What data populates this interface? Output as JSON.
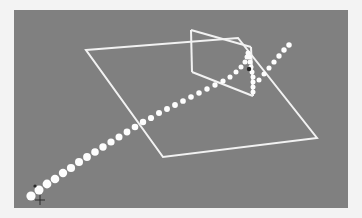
{
  "figure": {
    "background_color": "#808080",
    "frame_color": "#f3f3f3",
    "line_color": "#f2f2f2",
    "ball_color": "#fdfdfd",
    "marker_color": "#2a2a2a"
  },
  "chart_data": {
    "type": "scatter",
    "subtitle": "",
    "xlabel": "",
    "ylabel": "",
    "grid": false,
    "legend": "none",
    "projection": "3d-perspective",
    "xlim": [
      0,
      334
    ],
    "ylim": [
      0,
      198
    ],
    "annotations": [],
    "series": [
      {
        "name": "ball-trajectory",
        "marker": "circle",
        "color": "#fdfdfd",
        "points": [
          {
            "x": 17,
            "y": 186,
            "r": 4.6
          },
          {
            "x": 25,
            "y": 180,
            "r": 4.5
          },
          {
            "x": 33,
            "y": 174,
            "r": 4.4
          },
          {
            "x": 41,
            "y": 169,
            "r": 4.3
          },
          {
            "x": 49,
            "y": 163,
            "r": 4.2
          },
          {
            "x": 57,
            "y": 158,
            "r": 4.1
          },
          {
            "x": 65,
            "y": 152,
            "r": 4.0
          },
          {
            "x": 73,
            "y": 147,
            "r": 3.9
          },
          {
            "x": 81,
            "y": 142,
            "r": 3.8
          },
          {
            "x": 89,
            "y": 137,
            "r": 3.7
          },
          {
            "x": 97,
            "y": 132,
            "r": 3.6
          },
          {
            "x": 105,
            "y": 127,
            "r": 3.5
          },
          {
            "x": 113,
            "y": 122,
            "r": 3.4
          },
          {
            "x": 121,
            "y": 117,
            "r": 3.3
          },
          {
            "x": 129,
            "y": 112,
            "r": 3.2
          },
          {
            "x": 137,
            "y": 108,
            "r": 3.1
          },
          {
            "x": 145,
            "y": 103,
            "r": 3.0
          },
          {
            "x": 153,
            "y": 99,
            "r": 2.95
          },
          {
            "x": 161,
            "y": 95,
            "r": 2.9
          },
          {
            "x": 169,
            "y": 91,
            "r": 2.85
          },
          {
            "x": 177,
            "y": 87,
            "r": 2.8
          },
          {
            "x": 185,
            "y": 83,
            "r": 2.75
          },
          {
            "x": 193,
            "y": 79,
            "r": 2.7
          },
          {
            "x": 201,
            "y": 75,
            "r": 2.65
          },
          {
            "x": 209,
            "y": 71,
            "r": 2.6
          },
          {
            "x": 216,
            "y": 67,
            "r": 2.55
          },
          {
            "x": 222,
            "y": 62,
            "r": 2.5
          },
          {
            "x": 227,
            "y": 57,
            "r": 2.5
          },
          {
            "x": 231,
            "y": 52,
            "r": 2.5
          },
          {
            "x": 233,
            "y": 47,
            "r": 2.5
          },
          {
            "x": 234,
            "y": 43,
            "r": 2.5
          },
          {
            "x": 235,
            "y": 47,
            "r": 2.5
          },
          {
            "x": 236,
            "y": 52,
            "r": 2.5
          },
          {
            "x": 237,
            "y": 57,
            "r": 2.5
          },
          {
            "x": 238,
            "y": 62,
            "r": 2.5
          },
          {
            "x": 239,
            "y": 67,
            "r": 2.5
          },
          {
            "x": 239,
            "y": 72,
            "r": 2.5
          },
          {
            "x": 239,
            "y": 77,
            "r": 2.5
          },
          {
            "x": 239,
            "y": 82,
            "r": 2.5
          }
        ]
      },
      {
        "name": "ball-rebound",
        "marker": "circle",
        "color": "#fdfdfd",
        "points": [
          {
            "x": 245,
            "y": 70,
            "r": 2.5
          },
          {
            "x": 250,
            "y": 64,
            "r": 2.5
          },
          {
            "x": 255,
            "y": 58,
            "r": 2.55
          },
          {
            "x": 260,
            "y": 52,
            "r": 2.6
          },
          {
            "x": 265,
            "y": 46,
            "r": 2.65
          },
          {
            "x": 270,
            "y": 40,
            "r": 2.7
          },
          {
            "x": 275,
            "y": 35,
            "r": 2.75
          }
        ]
      }
    ],
    "markers": [
      {
        "name": "impact-point",
        "x": 235,
        "y": 59,
        "r": 2.2,
        "color": "#2a2a2a"
      },
      {
        "name": "origin-point",
        "x": 21,
        "y": 176,
        "r": 1.6,
        "color": "#2a2a2a"
      },
      {
        "name": "origin-cross",
        "x": 26,
        "y": 190,
        "size": 5,
        "color": "#2a2a2a"
      }
    ],
    "geometry": {
      "table": {
        "name": "table-outline",
        "points": [
          [
            72,
            40
          ],
          [
            224,
            28
          ],
          [
            303,
            128
          ],
          [
            149,
            147
          ]
        ]
      },
      "net": {
        "name": "net-outline",
        "top_left": [
          177,
          20
        ],
        "top_right": [
          237,
          37
        ],
        "bottom_right": [
          239,
          86
        ],
        "bottom_left": [
          178,
          62
        ],
        "post_left": [
          [
            177,
            20
          ],
          [
            178,
            62
          ]
        ],
        "post_right": [
          [
            237,
            37
          ],
          [
            239,
            86
          ]
        ],
        "top_cord": [
          [
            177,
            20
          ],
          [
            237,
            37
          ]
        ],
        "base_cord": [
          [
            178,
            62
          ],
          [
            239,
            86
          ]
        ]
      }
    }
  }
}
